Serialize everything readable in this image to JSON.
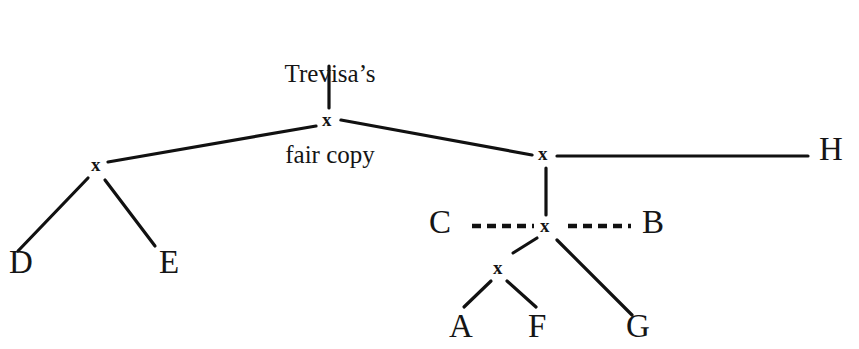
{
  "figure": {
    "background_color": "#ffffff",
    "line_color": "#111111",
    "text_color": "#151515",
    "width": 859,
    "height": 349
  },
  "root": {
    "line1": "Trevisa’s",
    "line2": "fair copy"
  },
  "nodes": [
    {
      "id": "x-root",
      "glyph": "x",
      "x": 328,
      "y": 122
    },
    {
      "id": "x-left",
      "glyph": "x",
      "x": 97,
      "y": 167
    },
    {
      "id": "x-right-upper",
      "glyph": "x",
      "x": 544,
      "y": 156
    },
    {
      "id": "x-right-lower",
      "glyph": "x",
      "x": 546,
      "y": 228
    },
    {
      "id": "x-bottom",
      "glyph": "x",
      "x": 499,
      "y": 270
    }
  ],
  "witnesses": [
    {
      "id": "D",
      "label": "D",
      "x": 20,
      "y": 268
    },
    {
      "id": "E",
      "label": "E",
      "x": 170,
      "y": 268
    },
    {
      "id": "H",
      "label": "H",
      "x": 830,
      "y": 155
    },
    {
      "id": "C",
      "label": "C",
      "x": 440,
      "y": 228
    },
    {
      "id": "B",
      "label": "B",
      "x": 653,
      "y": 228
    },
    {
      "id": "A",
      "label": "A",
      "x": 460,
      "y": 332
    },
    {
      "id": "F",
      "label": "F",
      "x": 539,
      "y": 332
    },
    {
      "id": "G",
      "label": "G",
      "x": 637,
      "y": 332
    }
  ],
  "edges": [
    {
      "id": "root-to-x",
      "from": "Trevisa's fair copy",
      "to": "x-root",
      "style": "solid",
      "x1": 329,
      "y1": 66,
      "x2": 329,
      "y2": 108
    },
    {
      "id": "x-root-to-x-left",
      "from": "x-root",
      "to": "x-left",
      "style": "solid",
      "x1": 316,
      "y1": 126,
      "x2": 108,
      "y2": 162
    },
    {
      "id": "x-root-to-x-right",
      "from": "x-root",
      "to": "x-right-upper",
      "style": "solid",
      "x1": 341,
      "y1": 120,
      "x2": 532,
      "y2": 155
    },
    {
      "id": "x-left-to-D",
      "from": "x-left",
      "to": "D",
      "style": "solid",
      "x1": 88,
      "y1": 178,
      "x2": 18,
      "y2": 251
    },
    {
      "id": "x-left-to-E",
      "from": "x-left",
      "to": "E",
      "style": "solid",
      "x1": 105,
      "y1": 180,
      "x2": 155,
      "y2": 246
    },
    {
      "id": "x-right-upper-to-H",
      "from": "x-right-upper",
      "to": "H",
      "style": "solid",
      "x1": 557,
      "y1": 156,
      "x2": 808,
      "y2": 156
    },
    {
      "id": "x-right-upper-to-x-right-lower",
      "from": "x-right-upper",
      "to": "x-right-lower",
      "style": "solid",
      "x1": 546,
      "y1": 168,
      "x2": 546,
      "y2": 215
    },
    {
      "id": "C-to-x-right-lower",
      "from": "C",
      "to": "x-right-lower",
      "style": "dashed",
      "x1": 472,
      "y1": 226,
      "x2": 534,
      "y2": 226
    },
    {
      "id": "x-right-lower-to-B",
      "from": "x-right-lower",
      "to": "B",
      "style": "dashed",
      "x1": 568,
      "y1": 226,
      "x2": 631,
      "y2": 226
    },
    {
      "id": "x-right-lower-to-x-bottom",
      "from": "x-right-lower",
      "to": "x-bottom",
      "style": "solid",
      "x1": 537,
      "y1": 238,
      "x2": 513,
      "y2": 253
    },
    {
      "id": "x-right-lower-to-G",
      "from": "x-right-lower",
      "to": "G",
      "style": "solid",
      "x1": 557,
      "y1": 240,
      "x2": 632,
      "y2": 315
    },
    {
      "id": "x-bottom-to-A",
      "from": "x-bottom",
      "to": "A",
      "style": "solid",
      "x1": 491,
      "y1": 281,
      "x2": 464,
      "y2": 307
    },
    {
      "id": "x-bottom-to-F",
      "from": "x-bottom",
      "to": "F",
      "style": "solid",
      "x1": 507,
      "y1": 281,
      "x2": 536,
      "y2": 307
    }
  ]
}
